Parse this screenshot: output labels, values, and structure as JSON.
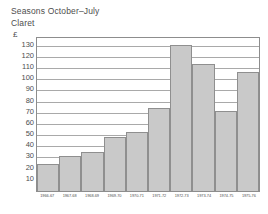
{
  "chart_data": {
    "type": "bar",
    "title": "Seasons October–July",
    "subtitle": "Claret",
    "unit_label": "£",
    "xlabel": "",
    "ylabel": "£",
    "categories": [
      "1966-67",
      "1967-68",
      "1968-69",
      "1969-70",
      "1970-71",
      "1971-72",
      "1972-73",
      "1973-74",
      "1974-75",
      "1975-76"
    ],
    "values": [
      24,
      31,
      35,
      48,
      53,
      74,
      131,
      114,
      72,
      107
    ],
    "ylim": [
      0,
      137
    ],
    "yticks": [
      10,
      20,
      30,
      40,
      50,
      60,
      70,
      80,
      90,
      100,
      110,
      120,
      130
    ],
    "grid": true,
    "legend": false,
    "bar_color": "#c9c9c9",
    "bar_border_color": "#8f8f8f",
    "gridline_color": "#a9a9a9",
    "frame_color": "#8d8d8d",
    "text_color": "#4e4e4e"
  }
}
